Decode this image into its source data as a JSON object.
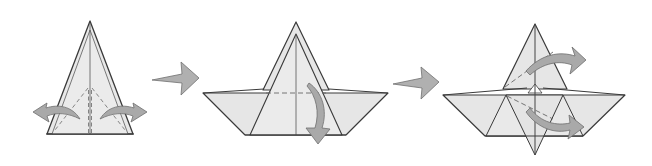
{
  "diagram": {
    "type": "origami-instructions",
    "colors": {
      "background": "#ffffff",
      "paper_fill": "#e6e6e6",
      "paper_fill_light": "#ececec",
      "paper_stroke": "#3a3a3a",
      "crease_line": "#555555",
      "arrow_fill": "#a9a9a9",
      "arrow_stroke": "#6e6e6e",
      "gap_fill": "#ffffff"
    },
    "steps": [
      {
        "index": 1,
        "shape": "tall-kite-triangle",
        "description": "Tall layered triangle with center crease and dashed valley folds; open side flaps outward",
        "arrows": [
          {
            "name": "open-left-flap",
            "direction": "left",
            "style": "curved"
          },
          {
            "name": "open-right-flap",
            "direction": "right",
            "style": "curved"
          }
        ],
        "lines": [
          "center-crease",
          "dashed-diagonal-left",
          "dashed-diagonal-right",
          "dashed-center-double"
        ]
      },
      {
        "index": 2,
        "shape": "boat",
        "description": "Boat shape with tall sail triangle and wide trapezoid hull; dashed horizontal fold line",
        "arrows": [
          {
            "name": "fold-down-front-flap",
            "direction": "down",
            "style": "curved"
          }
        ],
        "lines": [
          "center-crease",
          "dashed-horizontal-fold"
        ]
      },
      {
        "index": 3,
        "shape": "boat-with-flaps",
        "description": "Boat with triangular sail, inner triangles, bottom point; two curved arrows swinging flaps to the right",
        "arrows": [
          {
            "name": "swing-upper-flap-right",
            "direction": "right",
            "style": "curved"
          },
          {
            "name": "swing-lower-flap-right",
            "direction": "right",
            "style": "curved"
          }
        ],
        "lines": [
          "center-crease",
          "dashed-upper-diagonal",
          "dashed-lower-diagonal"
        ]
      }
    ],
    "transitions": [
      {
        "from": 1,
        "to": 2,
        "icon": "step-arrow-right"
      },
      {
        "from": 2,
        "to": 3,
        "icon": "step-arrow-right"
      }
    ]
  }
}
